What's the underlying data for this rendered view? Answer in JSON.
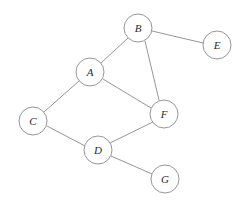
{
  "diagram": {
    "type": "node-link-graph",
    "background_color": "#ffffff",
    "node_fill_color": "#ffffff",
    "node_stroke_color": "#8a8a8a",
    "edge_color": "#8a8a8a",
    "label_color": "#2b2b2b",
    "node_radius": 14,
    "canvas": {
      "width": 243,
      "height": 209
    },
    "nodes": [
      {
        "id": "A",
        "label": "A",
        "cx": 90,
        "cy": 72,
        "r": 14
      },
      {
        "id": "B",
        "label": "B",
        "cx": 138,
        "cy": 28,
        "r": 14
      },
      {
        "id": "C",
        "label": "C",
        "cx": 33,
        "cy": 121,
        "r": 14
      },
      {
        "id": "D",
        "label": "D",
        "cx": 98,
        "cy": 150,
        "r": 14
      },
      {
        "id": "E",
        "label": "E",
        "cx": 217,
        "cy": 45,
        "r": 14
      },
      {
        "id": "F",
        "label": "F",
        "cx": 164,
        "cy": 114,
        "r": 14
      },
      {
        "id": "G",
        "label": "G",
        "cx": 165,
        "cy": 179,
        "r": 14
      }
    ],
    "edges": [
      {
        "id": "A-B",
        "source": "A",
        "target": "B",
        "x1": 101,
        "y1": 63,
        "x2": 128,
        "y2": 38
      },
      {
        "id": "B-E",
        "source": "B",
        "target": "E",
        "x1": 152,
        "y1": 31,
        "x2": 203,
        "y2": 43
      },
      {
        "id": "B-F",
        "source": "B",
        "target": "F",
        "x1": 145,
        "y1": 41,
        "x2": 159,
        "y2": 100
      },
      {
        "id": "A-F",
        "source": "A",
        "target": "F",
        "x1": 103,
        "y1": 79,
        "x2": 151,
        "y2": 108
      },
      {
        "id": "A-C",
        "source": "A",
        "target": "C",
        "x1": 79,
        "y1": 81,
        "x2": 44,
        "y2": 112
      },
      {
        "id": "C-D",
        "source": "C",
        "target": "D",
        "x1": 47,
        "y1": 126,
        "x2": 85,
        "y2": 146
      },
      {
        "id": "D-F",
        "source": "D",
        "target": "F",
        "x1": 110,
        "y1": 143,
        "x2": 153,
        "y2": 122
      },
      {
        "id": "D-G",
        "source": "D",
        "target": "G",
        "x1": 111,
        "y1": 156,
        "x2": 152,
        "y2": 174
      }
    ]
  }
}
